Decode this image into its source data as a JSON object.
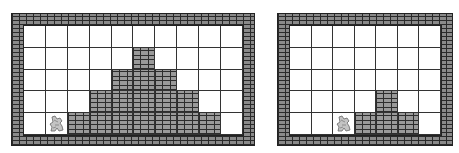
{
  "puzzles": [
    {
      "name": "left",
      "cols": 10,
      "rows": 5,
      "column_heights": [
        0,
        0,
        1,
        2,
        3,
        4,
        3,
        2,
        1,
        0
      ],
      "character_column": 1
    },
    {
      "name": "right",
      "cols": 7,
      "rows": 5,
      "column_heights": [
        0,
        0,
        0,
        1,
        2,
        1,
        0
      ],
      "character_column": 2
    }
  ],
  "colors": {
    "wall": "#8a8a8a",
    "mortar": "#2a2a2a",
    "empty": "#ffffff",
    "grid_line": "#333333"
  }
}
